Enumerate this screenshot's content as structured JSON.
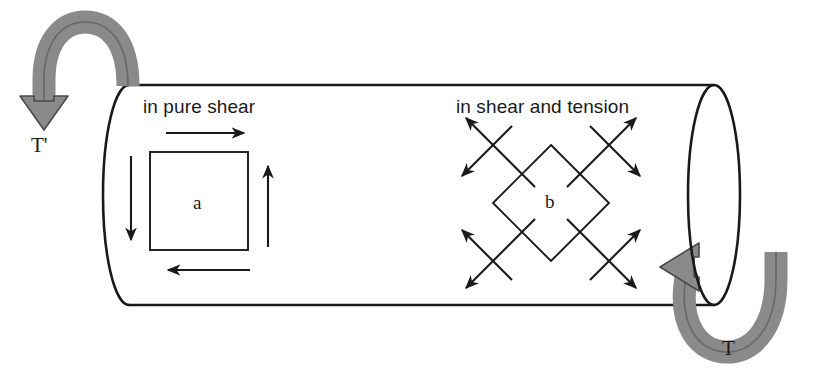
{
  "figure": {
    "type": "engineering-diagram",
    "background_color": "#ffffff",
    "line_color": "#1a1a1a",
    "torque_arrow_fill": "#8a8a8a",
    "torque_arrow_stroke": "#4a4a4a"
  },
  "labels": {
    "pure_shear": "in pure shear",
    "shear_and_tension": "in shear and tension",
    "torque_left": "T'",
    "torque_right": "T",
    "element_a": "a",
    "element_b": "b"
  },
  "shaft": {
    "left_x": 103,
    "right_x": 714,
    "top_y": 85,
    "bottom_y": 305,
    "ellipse_rx": 26,
    "ellipse_ry": 110
  },
  "element_a": {
    "name": "square-stress-element",
    "orientation_deg": 0,
    "center_x": 199,
    "center_y": 201,
    "half_size": 49,
    "arrows": [
      {
        "name": "top-shear-arrow",
        "direction": "right"
      },
      {
        "name": "bottom-shear-arrow",
        "direction": "left"
      },
      {
        "name": "right-shear-arrow",
        "direction": "up"
      },
      {
        "name": "left-shear-arrow",
        "direction": "down"
      }
    ]
  },
  "element_b": {
    "name": "rotated-stress-element",
    "orientation_deg": 45,
    "center_x": 551,
    "center_y": 203,
    "half_diagonal": 58,
    "arrow_pairs": [
      {
        "name": "top-left-arrow-pair",
        "tension": "up-left",
        "shear": "down-left"
      },
      {
        "name": "top-right-arrow-pair",
        "tension": "up-right",
        "shear": "down-right"
      },
      {
        "name": "bottom-left-arrow-pair",
        "tension": "down-left",
        "shear": "up-left"
      },
      {
        "name": "bottom-right-arrow-pair",
        "tension": "down-right",
        "shear": "up-right"
      }
    ]
  }
}
